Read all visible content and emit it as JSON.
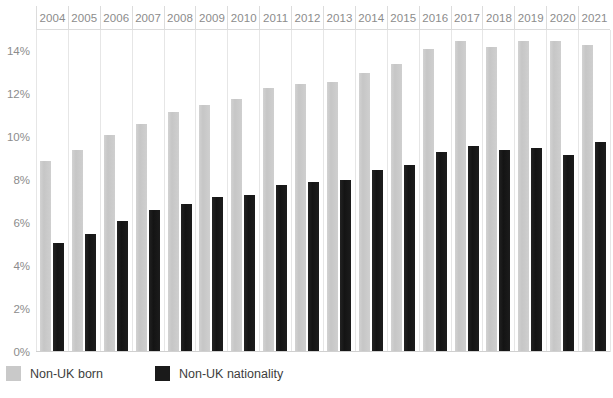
{
  "chart_data": {
    "type": "bar",
    "title": "",
    "subtitle": "",
    "xlabel": "",
    "ylabel": "",
    "grid": "vertical",
    "legend_position": "bottom-left",
    "ylim": [
      0,
      15
    ],
    "ytick_labels": [
      "14%",
      "12%",
      "10%",
      "8%",
      "6%",
      "4%",
      "2%",
      "0%"
    ],
    "ytick_values": [
      14,
      12,
      10,
      8,
      6,
      4,
      2,
      0
    ],
    "categories": [
      "2004",
      "2005",
      "2006",
      "2007",
      "2008",
      "2009",
      "2010",
      "2011",
      "2012",
      "2013",
      "2014",
      "2015",
      "2016",
      "2017",
      "2018",
      "2019",
      "2020",
      "2021"
    ],
    "series": [
      {
        "name": "Non-UK born",
        "color": "#c9c9c9",
        "values": [
          8.9,
          9.4,
          10.1,
          10.6,
          11.2,
          11.5,
          11.8,
          12.3,
          12.5,
          12.6,
          13.0,
          13.4,
          14.1,
          14.5,
          14.2,
          14.5,
          14.5,
          14.3
        ]
      },
      {
        "name": "Non-UK nationality",
        "color": "#1a1a1a",
        "values": [
          5.1,
          5.5,
          6.1,
          6.6,
          6.9,
          7.2,
          7.3,
          7.8,
          7.9,
          8.0,
          8.5,
          8.7,
          9.3,
          9.6,
          9.4,
          9.5,
          9.2,
          9.8
        ]
      }
    ]
  },
  "legend": {
    "items": [
      {
        "label": "Non-UK born",
        "swatch": "born"
      },
      {
        "label": "Non-UK nationality",
        "swatch": "nationality"
      }
    ]
  }
}
